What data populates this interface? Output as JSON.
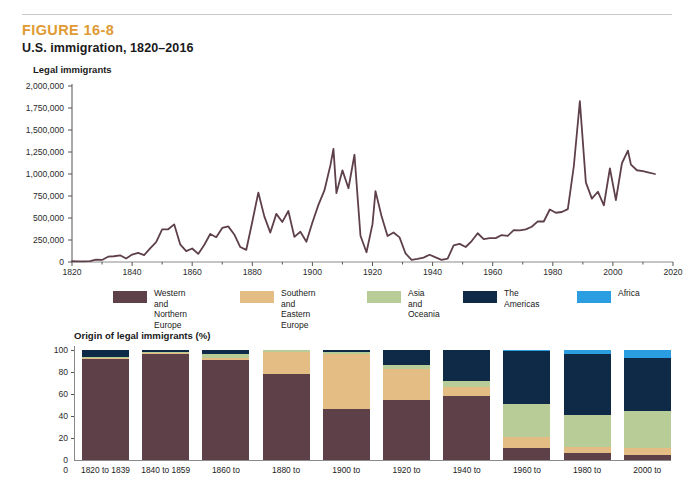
{
  "figure": {
    "label": "FIGURE 16-8",
    "title": "U.S. immigration, 1820–2016",
    "label_color": "#e09a33"
  },
  "line_axis_title": "Legal immigrants",
  "bars_axis_title": "Origin of legal immigrants (%)",
  "legend": [
    {
      "label": "Western and\nNorthern Europe",
      "color": "#5e4049"
    },
    {
      "label": "Southern and\nEastern Europe",
      "color": "#e3bd83"
    },
    {
      "label": "Asia and Oceania",
      "color": "#b8cc98"
    },
    {
      "label": "The Americas",
      "color": "#0e2a47"
    },
    {
      "label": "Africa",
      "color": "#2a9ee0"
    }
  ],
  "chart_data": [
    {
      "type": "line",
      "title": "U.S. immigration, 1820–2016",
      "xlabel": "",
      "ylabel": "Legal immigrants",
      "xlim": [
        1820,
        2020
      ],
      "ylim": [
        0,
        2000000
      ],
      "xticks": [
        1820,
        1840,
        1860,
        1880,
        1900,
        1920,
        1940,
        1960,
        1980,
        2000,
        2020
      ],
      "yticks": [
        0,
        250000,
        500000,
        750000,
        1000000,
        1250000,
        1500000,
        1750000,
        2000000
      ],
      "ytick_labels": [
        "0",
        "250,000",
        "500,000",
        "750,000",
        "1,000,000",
        "1,250,000",
        "1,500,000",
        "1,750,000",
        "2,000,000"
      ],
      "grid": false,
      "line_color": "#5e4049",
      "series": [
        {
          "name": "Legal immigrants",
          "x": [
            1820,
            1822,
            1824,
            1826,
            1828,
            1830,
            1832,
            1834,
            1836,
            1838,
            1840,
            1842,
            1844,
            1846,
            1848,
            1850,
            1852,
            1854,
            1856,
            1858,
            1860,
            1862,
            1864,
            1866,
            1868,
            1870,
            1872,
            1874,
            1876,
            1878,
            1880,
            1882,
            1884,
            1886,
            1888,
            1890,
            1892,
            1894,
            1896,
            1898,
            1900,
            1902,
            1904,
            1906,
            1907,
            1908,
            1910,
            1912,
            1914,
            1916,
            1918,
            1920,
            1921,
            1923,
            1925,
            1927,
            1929,
            1931,
            1933,
            1935,
            1937,
            1939,
            1941,
            1943,
            1945,
            1947,
            1949,
            1951,
            1953,
            1955,
            1957,
            1959,
            1961,
            1963,
            1965,
            1967,
            1969,
            1971,
            1973,
            1975,
            1977,
            1979,
            1981,
            1983,
            1985,
            1987,
            1989,
            1991,
            1993,
            1995,
            1997,
            1999,
            2001,
            2003,
            2005,
            2006,
            2008,
            2010,
            2012,
            2014,
            2016
          ],
          "y": [
            8385,
            6911,
            7912,
            10837,
            27382,
            23322,
            60482,
            65365,
            76242,
            38914,
            84066,
            104565,
            78615,
            154416,
            226527,
            369980,
            371603,
            427833,
            200436,
            123126,
            153640,
            91985,
            193418,
            318568,
            282189,
            387203,
            404806,
            313339,
            169986,
            138469,
            457257,
            788992,
            518592,
            334203,
            546889,
            455302,
            579663,
            285631,
            343267,
            229299,
            448572,
            648743,
            812870,
            1100735,
            1285349,
            782870,
            1041570,
            838172,
            1218480,
            298826,
            110618,
            430001,
            805228,
            522919,
            294314,
            335175,
            279678,
            97139,
            23068,
            34956,
            50244,
            82998,
            51776,
            23725,
            38119,
            188317,
            205717,
            170434,
            237790,
            326867,
            260686,
            271344,
            271297,
            306260,
            296697,
            361972,
            358579,
            370478,
            400063,
            462315,
            460348,
            596600,
            559763,
            568149,
            601516,
            1090924,
            1827167,
            904292,
            720461,
            798378,
            644787,
            1064318,
            703542,
            1122257,
            1266129,
            1107126,
            1042625,
            1031631,
            1016518,
            1000000
          ]
        }
      ]
    },
    {
      "type": "bar",
      "subtype": "stacked-percent",
      "title": "Origin of legal immigrants (%)",
      "xlabel": "",
      "ylabel": "Origin of legal immigrants (%)",
      "ylim": [
        0,
        100
      ],
      "yticks": [
        0,
        20,
        40,
        60,
        80,
        100
      ],
      "grid": false,
      "categories": [
        "1820 to 1839",
        "1840 to 1859",
        "1860 to",
        "1880 to",
        "1900 to",
        "1920 to",
        "1940 to",
        "1960 to",
        "1980 to",
        "2000 to"
      ],
      "series": [
        {
          "name": "Western and Northern Europe",
          "color": "#5e4049",
          "values": [
            92,
            96,
            91,
            78,
            46,
            55,
            58,
            11,
            6,
            5
          ]
        },
        {
          "name": "Southern and Eastern Europe",
          "color": "#e3bd83",
          "values": [
            1,
            1,
            2,
            20,
            50,
            28,
            8,
            10,
            6,
            6
          ]
        },
        {
          "name": "Asia and Oceania",
          "color": "#b8cc98",
          "values": [
            1,
            1,
            3,
            2,
            2,
            3,
            6,
            30,
            29,
            34
          ]
        },
        {
          "name": "The Americas",
          "color": "#0e2a47",
          "values": [
            6,
            2,
            4,
            0,
            2,
            14,
            28,
            48,
            55,
            48
          ]
        },
        {
          "name": "Africa",
          "color": "#2a9ee0",
          "values": [
            0,
            0,
            0,
            0,
            0,
            0,
            0,
            1,
            4,
            7
          ]
        }
      ]
    }
  ]
}
